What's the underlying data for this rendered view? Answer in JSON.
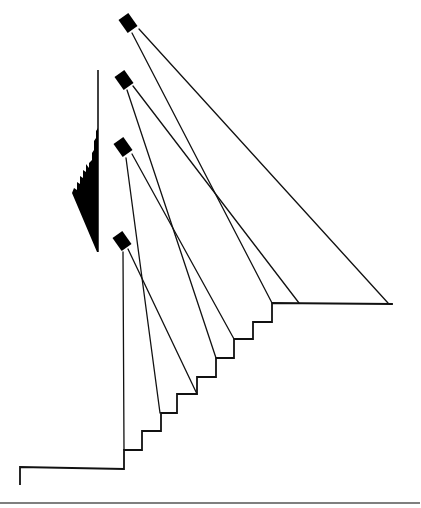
{
  "figure": {
    "line_color": "#111111",
    "fill_color": "#000000",
    "background": "#ffffff"
  },
  "components": {
    "fixtures": [
      {
        "id": "fixture-1",
        "beams_to": [
          "top-landing-far-end",
          "top-landing-corner"
        ]
      },
      {
        "id": "fixture-2",
        "beams_to": [
          "top-landing-near",
          "step-9"
        ]
      },
      {
        "id": "fixture-3",
        "beams_to": [
          "step-8",
          "step-4"
        ]
      },
      {
        "id": "fixture-4",
        "beams_to": [
          "step-6",
          "step-2"
        ]
      }
    ],
    "staircase": {
      "step_count": 10,
      "has_top_landing": true,
      "has_bottom_floor": true
    },
    "wall": {
      "has_mounted_element": true
    },
    "ground_rule": true
  }
}
